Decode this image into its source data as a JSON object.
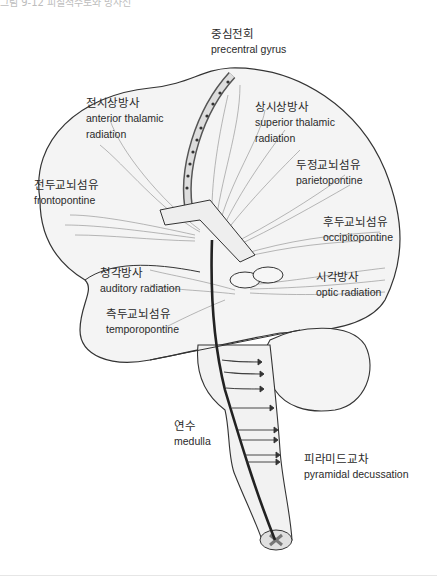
{
  "caption": "그림 9-12 피질척수로와 방사선",
  "colors": {
    "outline": "#333333",
    "fiber": "#888888",
    "tract": "#222222",
    "text": "#2a2a2a",
    "fill": "#f2f2f2"
  },
  "labels": {
    "precentral": {
      "ko": "중심전회",
      "en": "precentral gyrus"
    },
    "anterior_thalamic": {
      "ko": "전시상방사",
      "en": "anterior thalamic",
      "en2": "radiation"
    },
    "superior_thalamic": {
      "ko": "상시상방사",
      "en": "superior thalamic",
      "en2": "radiation"
    },
    "parietopontine": {
      "ko": "두정교뇌섬유",
      "en": "parietopontine"
    },
    "frontopontine": {
      "ko": "전두교뇌섬유",
      "en": "frontopontine"
    },
    "occipitopontine": {
      "ko": "후두교뇌섬유",
      "en": "occipitopontine"
    },
    "auditory": {
      "ko": "청각방사",
      "en": "auditory radiation"
    },
    "optic": {
      "ko": "시각방사",
      "en": "optic radiation"
    },
    "temporopontine": {
      "ko": "측두교뇌섬유",
      "en": "temporopontine"
    },
    "medulla": {
      "ko": "연수",
      "en": "medulla"
    },
    "pyramidal": {
      "ko": "피라미드교차",
      "en": "pyramidal decussation"
    }
  }
}
